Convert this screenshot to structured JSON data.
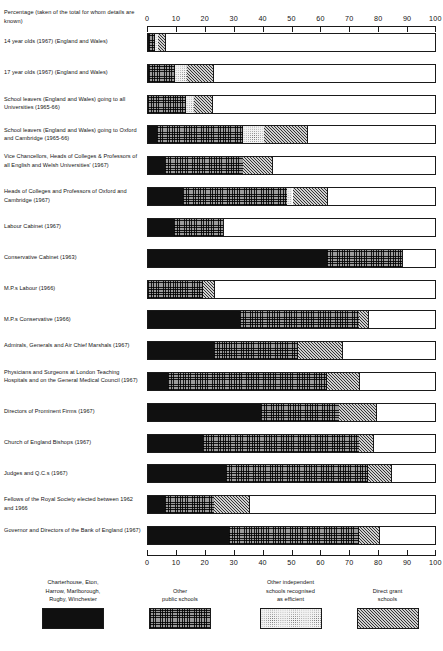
{
  "axis_caption": "Percentage (taken of the total for whom details are known)",
  "chart_data": {
    "type": "bar",
    "orientation": "horizontal",
    "stacked": true,
    "title": "",
    "xlabel": "Percentage (taken of the total for whom details are known)",
    "ylabel": "",
    "xlim": [
      0,
      100
    ],
    "xticks": [
      0,
      10,
      20,
      30,
      40,
      50,
      60,
      70,
      80,
      90,
      100
    ],
    "grid": false,
    "legend_position": "bottom",
    "axis_duplicated_top_and_bottom": true,
    "series": [
      {
        "name": "Charterhouse, Eton, Harrow, Marlborough, Rugby, Winchester",
        "values": [
          0.4,
          0.5,
          3.0,
          6.0,
          6.0,
          12.0,
          9.0,
          62.0,
          0.0,
          32.0,
          23.0,
          7.0,
          39.0,
          19.0,
          27.0,
          6.0,
          28.0
        ]
      },
      {
        "name": "Other public schools",
        "values": [
          2.1,
          9.0,
          13.0,
          30.0,
          27.0,
          36.0,
          17.0,
          26.0,
          19.0,
          41.0,
          29.0,
          55.0,
          27.0,
          54.0,
          49.0,
          17.0,
          45.0
        ]
      },
      {
        "name": "Other independent schools recognised as efficient",
        "values": [
          1.0,
          4.0,
          3.0,
          7.0,
          0.0,
          2.0,
          0.0,
          0.0,
          0.0,
          0.0,
          0.0,
          0.0,
          0.0,
          0.0,
          0.0,
          0.0,
          0.0
        ]
      },
      {
        "name": "Direct grant schools",
        "values": [
          2.5,
          9.0,
          6.0,
          15.0,
          10.0,
          12.0,
          0.0,
          0.0,
          4.0,
          3.0,
          15.0,
          11.0,
          13.0,
          5.0,
          8.0,
          12.0,
          7.0
        ]
      }
    ],
    "categories": [
      "14 year olds (1967) (England and Wales)",
      "17 year olds (1967) (England and Wales)",
      "School leavers (England and Wales) going to all Universities (1965-66)",
      "School leavers (England and Wales) going to Oxford and Cambridge (1965-66)",
      "Vice Chancellors, Heads of Colleges & Professors of all English and Welsh Universities' (1967)",
      "Heads of Colleges and Professors of Oxford and Cambridge (1967)",
      "Labour Cabinet (1967)",
      "Conservative Cabinet (1963)",
      "M.P.s Labour (1966)",
      "M.P.s Conservative (1966)",
      "Admirals, Generals and Air Chief Marshals (1967)",
      "Physicians and Surgeons at London Teaching Hospitals and on the General Medical Council (1967)",
      "Directors of Prominent Firms (1967)",
      "Church of England Bishops (1967)",
      "Judges and Q.C.s (1967)",
      "Fellows of the Royal Society elected between 1962 and 1966",
      "Governor and Directors of the Bank of England (1967)"
    ]
  },
  "rows": [
    {
      "label": "14 year olds (1967) (England and Wales)",
      "segments": [
        {
          "type": 0,
          "start": 0.0,
          "end": 0.4
        },
        {
          "type": 1,
          "start": 0.4,
          "end": 2.5
        },
        {
          "type": 2,
          "start": 2.5,
          "end": 3.5
        },
        {
          "type": 3,
          "start": 3.5,
          "end": 6.0
        }
      ]
    },
    {
      "label": "17 year olds (1967) (England and Wales)",
      "segments": [
        {
          "type": 0,
          "start": 0.0,
          "end": 0.5
        },
        {
          "type": 1,
          "start": 0.5,
          "end": 9.5
        },
        {
          "type": 2,
          "start": 9.5,
          "end": 13.5
        },
        {
          "type": 3,
          "start": 13.5,
          "end": 22.5
        }
      ]
    },
    {
      "label": "School leavers (England and Wales) going to all Universities (1965-66)",
      "segments": [
        {
          "type": 1,
          "start": 0.0,
          "end": 13.0
        },
        {
          "type": 2,
          "start": 13.0,
          "end": 16.0
        },
        {
          "type": 3,
          "start": 16.0,
          "end": 22.0
        }
      ]
    },
    {
      "label": "School leavers (England and Wales) going to Oxford and Cambridge (1965-66)",
      "segments": [
        {
          "type": 0,
          "start": 0.0,
          "end": 3.0
        },
        {
          "type": 1,
          "start": 3.0,
          "end": 33.0
        },
        {
          "type": 2,
          "start": 33.0,
          "end": 40.0
        },
        {
          "type": 3,
          "start": 40.0,
          "end": 55.0
        }
      ]
    },
    {
      "label": "Vice Chancellors, Heads of Colleges & Professors of all English and Welsh Universities' (1967)",
      "segments": [
        {
          "type": 0,
          "start": 0.0,
          "end": 6.0
        },
        {
          "type": 1,
          "start": 6.0,
          "end": 33.0
        },
        {
          "type": 3,
          "start": 33.0,
          "end": 43.0
        }
      ]
    },
    {
      "label": "Heads of Colleges and Professors of Oxford and Cambridge (1967)",
      "segments": [
        {
          "type": 0,
          "start": 0.0,
          "end": 12.0
        },
        {
          "type": 1,
          "start": 12.0,
          "end": 48.0
        },
        {
          "type": 2,
          "start": 48.0,
          "end": 50.0
        },
        {
          "type": 3,
          "start": 50.0,
          "end": 62.0
        }
      ]
    },
    {
      "label": "Labour Cabinet (1967)",
      "segments": [
        {
          "type": 0,
          "start": 0.0,
          "end": 9.0
        },
        {
          "type": 1,
          "start": 9.0,
          "end": 26.0
        }
      ]
    },
    {
      "label": "Conservative Cabinet (1963)",
      "segments": [
        {
          "type": 0,
          "start": 0.0,
          "end": 62.0
        },
        {
          "type": 1,
          "start": 62.0,
          "end": 88.0
        }
      ]
    },
    {
      "label": "M.P.s Labour (1966)",
      "segments": [
        {
          "type": 1,
          "start": 0.0,
          "end": 19.0
        },
        {
          "type": 3,
          "start": 19.0,
          "end": 23.0
        }
      ]
    },
    {
      "label": "M.P.s Conservative (1966)",
      "segments": [
        {
          "type": 0,
          "start": 0.0,
          "end": 32.0
        },
        {
          "type": 1,
          "start": 32.0,
          "end": 73.0
        },
        {
          "type": 3,
          "start": 73.0,
          "end": 76.0
        }
      ]
    },
    {
      "label": "Admirals, Generals and Air Chief Marshals (1967)",
      "segments": [
        {
          "type": 0,
          "start": 0.0,
          "end": 23.0
        },
        {
          "type": 1,
          "start": 23.0,
          "end": 52.0
        },
        {
          "type": 3,
          "start": 52.0,
          "end": 67.0
        }
      ]
    },
    {
      "label": "Physicians and Surgeons at London Teaching Hospitals and on the General Medical Council (1967)",
      "segments": [
        {
          "type": 0,
          "start": 0.0,
          "end": 7.0
        },
        {
          "type": 1,
          "start": 7.0,
          "end": 62.0
        },
        {
          "type": 3,
          "start": 62.0,
          "end": 73.0
        }
      ]
    },
    {
      "label": "Directors of Prominent Firms (1967)",
      "segments": [
        {
          "type": 0,
          "start": 0.0,
          "end": 39.0
        },
        {
          "type": 1,
          "start": 39.0,
          "end": 66.0
        },
        {
          "type": 3,
          "start": 66.0,
          "end": 79.0
        }
      ]
    },
    {
      "label": "Church of England Bishops (1967)",
      "segments": [
        {
          "type": 0,
          "start": 0.0,
          "end": 19.0
        },
        {
          "type": 1,
          "start": 19.0,
          "end": 73.0
        },
        {
          "type": 3,
          "start": 73.0,
          "end": 78.0
        }
      ]
    },
    {
      "label": "Judges and Q.C.s (1967)",
      "segments": [
        {
          "type": 0,
          "start": 0.0,
          "end": 27.0
        },
        {
          "type": 1,
          "start": 27.0,
          "end": 76.0
        },
        {
          "type": 3,
          "start": 76.0,
          "end": 84.0
        }
      ]
    },
    {
      "label": "Fellows of the Royal Society elected between 1962 and 1966",
      "segments": [
        {
          "type": 0,
          "start": 0.0,
          "end": 6.0
        },
        {
          "type": 1,
          "start": 6.0,
          "end": 23.0
        },
        {
          "type": 3,
          "start": 23.0,
          "end": 35.0
        }
      ]
    },
    {
      "label": "Governor and Directors of the Bank of England (1967)",
      "segments": [
        {
          "type": 0,
          "start": 0.0,
          "end": 28.0
        },
        {
          "type": 1,
          "start": 28.0,
          "end": 73.0
        },
        {
          "type": 3,
          "start": 73.0,
          "end": 80.0
        }
      ]
    }
  ],
  "legend": [
    {
      "text": "Charterhouse, Eton,\nHarrow, Marlborough,\nRugby, Winchester",
      "swatch": "solid-black-swatch"
    },
    {
      "text": "Other\npublic schools",
      "swatch": "crosshatch-swatch"
    },
    {
      "text": "Other independent\nschools recognised\nas efficient",
      "swatch": "stipple-swatch"
    },
    {
      "text": "Direct grant\nschools",
      "swatch": "diagonal-hatch-swatch"
    }
  ]
}
